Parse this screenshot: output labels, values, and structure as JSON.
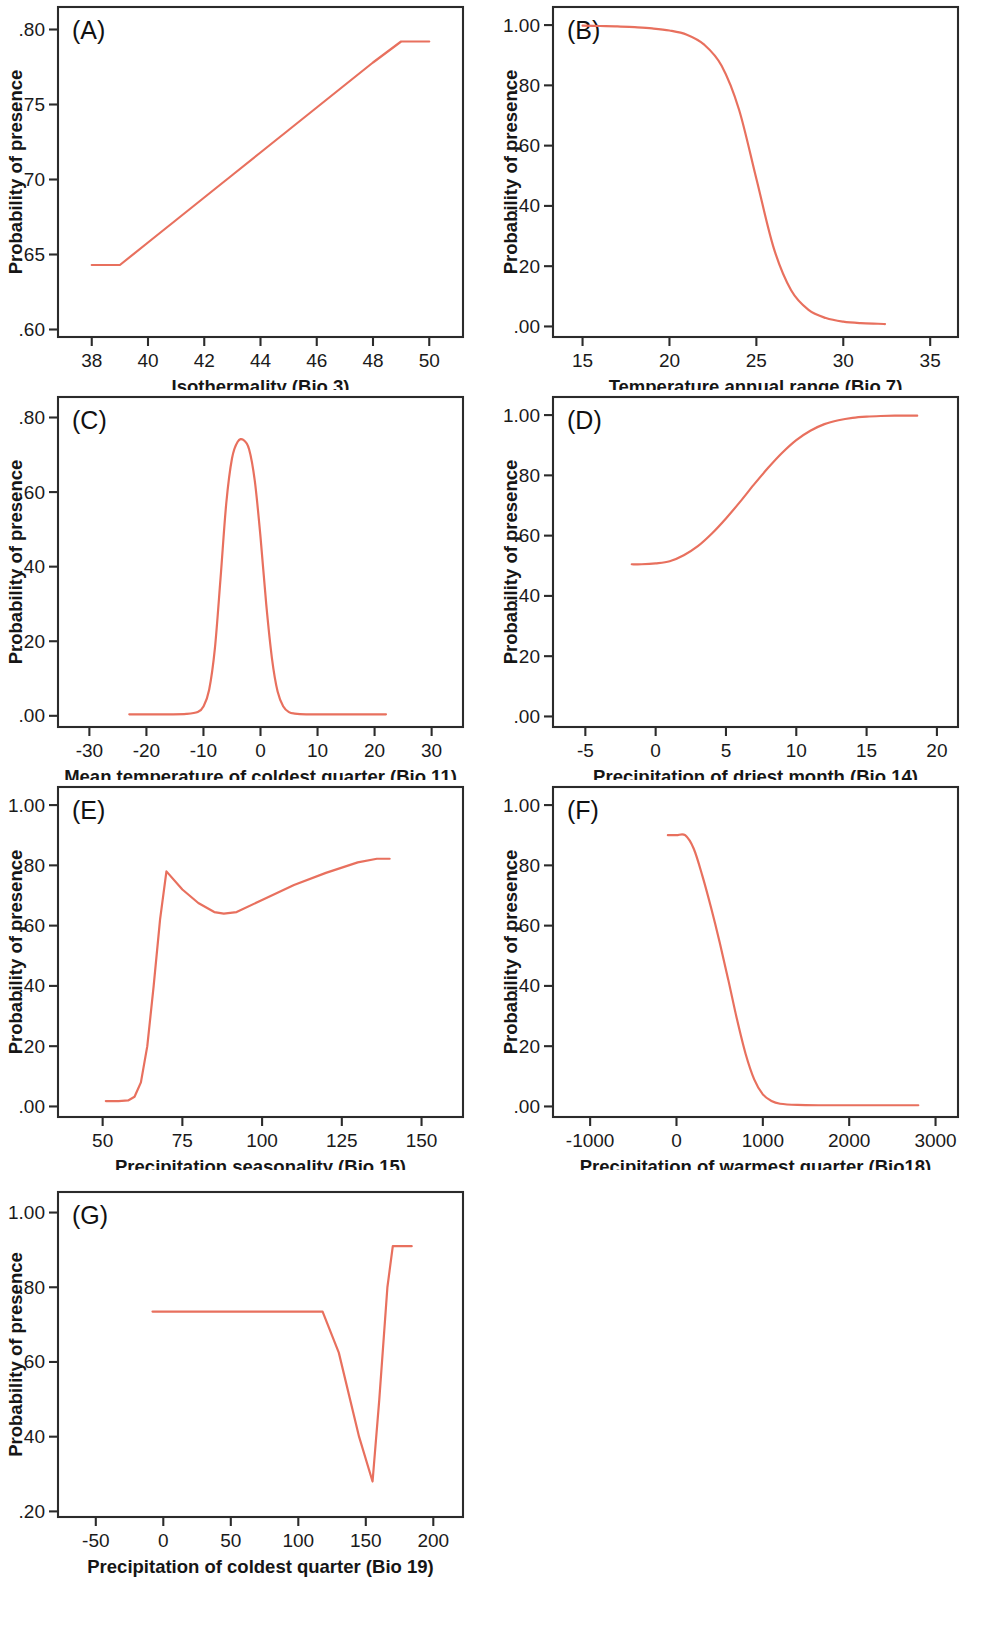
{
  "figure": {
    "background_color": "#ffffff",
    "curve_color": "#e8705e",
    "axis_color": "#2b2b2b",
    "shared_ylabel": "Probability of presence",
    "panel_count": 7
  },
  "panels": [
    {
      "letter": "(A)",
      "xlabel": "Isothermality (Bio 3)",
      "ylabel": "Probability of presence",
      "xticks": [
        38,
        40,
        42,
        44,
        46,
        48,
        50
      ],
      "xtick_labels": [
        "38",
        "40",
        "42",
        "44",
        "46",
        "48",
        "50"
      ],
      "yticks": [
        0.6,
        0.65,
        0.7,
        0.75,
        0.8
      ],
      "ytick_labels": [
        ".60",
        ".65",
        ".70",
        ".75",
        ".80"
      ],
      "xlim": [
        36.8,
        51.2
      ],
      "ylim": [
        0.595,
        0.815
      ]
    },
    {
      "letter": "(B)",
      "xlabel": "Temperature annual range (Bio 7)",
      "ylabel": "Probability of presence",
      "xticks": [
        15,
        20,
        25,
        30,
        35
      ],
      "xtick_labels": [
        "15",
        "20",
        "25",
        "30",
        "35"
      ],
      "yticks": [
        0.0,
        0.2,
        0.4,
        0.6,
        0.8,
        1.0
      ],
      "ytick_labels": [
        ".00",
        ".20",
        ".40",
        ".60",
        ".80",
        "1.00"
      ],
      "xlim": [
        13.3,
        36.6
      ],
      "ylim": [
        -0.035,
        1.06
      ]
    },
    {
      "letter": "(C)",
      "xlabel": "Mean temperature of coldest quarter (Bio 11)",
      "ylabel": "Probability of presence",
      "xticks": [
        -30,
        -20,
        -10,
        0,
        10,
        20,
        30
      ],
      "xtick_labels": [
        "-30",
        "-20",
        "-10",
        "0",
        "10",
        "20",
        "30"
      ],
      "yticks": [
        0.0,
        0.2,
        0.4,
        0.6,
        0.8
      ],
      "ytick_labels": [
        ".00",
        ".20",
        ".40",
        ".60",
        ".80"
      ],
      "xlim": [
        -35.5,
        35.5
      ],
      "ylim": [
        -0.03,
        0.855
      ]
    },
    {
      "letter": "(D)",
      "xlabel": "Precipitation of driest month (Bio 14)",
      "ylabel": "Probability of presence",
      "xticks": [
        -5,
        0,
        5,
        10,
        15,
        20
      ],
      "xtick_labels": [
        "-5",
        "0",
        "5",
        "10",
        "15",
        "20"
      ],
      "yticks": [
        0.0,
        0.2,
        0.4,
        0.6,
        0.8,
        1.0
      ],
      "ytick_labels": [
        ".00",
        ".20",
        ".40",
        ".60",
        ".80",
        "1.00"
      ],
      "xlim": [
        -7.3,
        21.5
      ],
      "ylim": [
        -0.035,
        1.06
      ]
    },
    {
      "letter": "(E)",
      "xlabel": "Precipitation seasonality (Bio 15)",
      "ylabel": "Probability of presence",
      "xticks": [
        50,
        75,
        100,
        125,
        150
      ],
      "xtick_labels": [
        "50",
        "75",
        "100",
        "125",
        "150"
      ],
      "yticks": [
        0.0,
        0.2,
        0.4,
        0.6,
        0.8,
        1.0
      ],
      "ytick_labels": [
        ".00",
        ".20",
        ".40",
        ".60",
        ".80",
        "1.00"
      ],
      "xlim": [
        36,
        163
      ],
      "ylim": [
        -0.035,
        1.06
      ]
    },
    {
      "letter": "(F)",
      "xlabel": "Precipitation of warmest quarter (Bio18)",
      "ylabel": "Probability of presence",
      "xticks": [
        -1000,
        0,
        1000,
        2000,
        3000
      ],
      "xtick_labels": [
        "-1000",
        "0",
        "1000",
        "2000",
        "3000"
      ],
      "yticks": [
        0.0,
        0.2,
        0.4,
        0.6,
        0.8,
        1.0
      ],
      "ytick_labels": [
        ".00",
        ".20",
        ".40",
        ".60",
        ".80",
        "1.00"
      ],
      "xlim": [
        -1430,
        3260
      ],
      "ylim": [
        -0.035,
        1.06
      ]
    },
    {
      "letter": "(G)",
      "xlabel": "Precipitation of coldest quarter (Bio 19)",
      "ylabel": "Probability of presence",
      "xticks": [
        -50,
        0,
        50,
        100,
        150,
        200
      ],
      "xtick_labels": [
        "-50",
        "0",
        "50",
        "100",
        "150",
        "200"
      ],
      "yticks": [
        0.2,
        0.4,
        0.6,
        0.8,
        1.0
      ],
      "ytick_labels": [
        ".20",
        ".40",
        ".60",
        ".80",
        "1.00"
      ],
      "xlim": [
        -78,
        222
      ],
      "ylim": [
        0.185,
        1.055
      ]
    }
  ],
  "chart_data": [
    {
      "type": "line",
      "panel": "(A)",
      "title": "(A)",
      "xlabel": "Isothermality (Bio 3)",
      "ylabel": "Probability of presence",
      "xlim": [
        36.8,
        51.2
      ],
      "ylim": [
        0.595,
        0.815
      ],
      "grid": false,
      "legend": "none",
      "color": "#e8705e",
      "x": [
        38.0,
        39.0,
        40.0,
        41.0,
        42.0,
        43.0,
        44.0,
        45.0,
        46.0,
        47.0,
        48.0,
        49.0,
        50.0
      ],
      "y": [
        0.643,
        0.643,
        0.658,
        0.673,
        0.688,
        0.703,
        0.718,
        0.733,
        0.748,
        0.763,
        0.778,
        0.792,
        0.792
      ]
    },
    {
      "type": "line",
      "panel": "(B)",
      "title": "(B)",
      "xlabel": "Temperature annual range (Bio 7)",
      "ylabel": "Probability of presence",
      "xlim": [
        13.3,
        36.6
      ],
      "ylim": [
        -0.035,
        1.06
      ],
      "grid": false,
      "legend": "none",
      "color": "#e8705e",
      "x": [
        15,
        16,
        17,
        18,
        19,
        20,
        21,
        22,
        23,
        24,
        25,
        26,
        27,
        28,
        29,
        30,
        31,
        32,
        32.4
      ],
      "y": [
        0.998,
        0.997,
        0.996,
        0.993,
        0.989,
        0.982,
        0.968,
        0.935,
        0.865,
        0.72,
        0.49,
        0.26,
        0.12,
        0.055,
        0.028,
        0.016,
        0.011,
        0.009,
        0.008
      ]
    },
    {
      "type": "line",
      "panel": "(C)",
      "title": "(C)",
      "xlabel": "Mean temperature of coldest quarter (Bio 11)",
      "ylabel": "Probability of presence",
      "xlim": [
        -35.5,
        35.5
      ],
      "ylim": [
        -0.03,
        0.855
      ],
      "grid": false,
      "legend": "none",
      "color": "#e8705e",
      "peak_x": -3.0,
      "peak_y": 0.74,
      "baseline": 0.004,
      "x": [
        -23,
        -20,
        -16,
        -13,
        -11,
        -10,
        -9,
        -8,
        -7,
        -6,
        -5,
        -4,
        -3,
        -2,
        -1,
        0,
        1,
        2,
        3,
        4,
        5,
        6,
        8,
        12,
        16,
        22
      ],
      "y": [
        0.004,
        0.004,
        0.004,
        0.005,
        0.01,
        0.025,
        0.07,
        0.18,
        0.37,
        0.57,
        0.69,
        0.735,
        0.74,
        0.715,
        0.63,
        0.48,
        0.3,
        0.155,
        0.065,
        0.025,
        0.01,
        0.006,
        0.004,
        0.004,
        0.004,
        0.004
      ]
    },
    {
      "type": "line",
      "panel": "(D)",
      "title": "(D)",
      "xlabel": "Precipitation of driest month (Bio 14)",
      "ylabel": "Probability of presence",
      "xlim": [
        -7.3,
        21.5
      ],
      "ylim": [
        -0.035,
        1.06
      ],
      "grid": false,
      "legend": "none",
      "color": "#e8705e",
      "x": [
        -1.7,
        -1,
        0,
        1,
        2,
        3,
        4,
        5,
        6,
        7,
        8,
        9,
        10,
        11,
        12,
        13,
        14,
        15,
        16,
        17,
        18.6
      ],
      "y": [
        0.505,
        0.505,
        0.508,
        0.515,
        0.535,
        0.565,
        0.607,
        0.657,
        0.712,
        0.77,
        0.825,
        0.875,
        0.917,
        0.948,
        0.97,
        0.983,
        0.991,
        0.995,
        0.997,
        0.998,
        0.998
      ]
    },
    {
      "type": "line",
      "panel": "(E)",
      "title": "(E)",
      "xlabel": "Precipitation seasonality (Bio 15)",
      "ylabel": "Probability of presence",
      "xlim": [
        36,
        163
      ],
      "ylim": [
        -0.035,
        1.06
      ],
      "grid": false,
      "legend": "none",
      "color": "#e8705e",
      "x": [
        51,
        55,
        58,
        60,
        62,
        64,
        66,
        68,
        70,
        75,
        80,
        85,
        88,
        92,
        100,
        110,
        120,
        130,
        136,
        140
      ],
      "y": [
        0.018,
        0.018,
        0.02,
        0.032,
        0.08,
        0.2,
        0.4,
        0.62,
        0.78,
        0.72,
        0.675,
        0.645,
        0.64,
        0.645,
        0.685,
        0.735,
        0.775,
        0.81,
        0.822,
        0.822
      ]
    },
    {
      "type": "line",
      "panel": "(F)",
      "title": "(F)",
      "xlabel": "Precipitation of warmest quarter (Bio18)",
      "ylabel": "Probability of presence",
      "xlim": [
        -1430,
        3260
      ],
      "ylim": [
        -0.035,
        1.06
      ],
      "grid": false,
      "legend": "none",
      "color": "#e8705e",
      "x": [
        -100,
        0,
        100,
        200,
        300,
        400,
        500,
        600,
        700,
        800,
        900,
        1000,
        1100,
        1200,
        1400,
        1700,
        2000,
        2400,
        2800
      ],
      "y": [
        0.9,
        0.9,
        0.9,
        0.855,
        0.765,
        0.66,
        0.545,
        0.42,
        0.29,
        0.175,
        0.09,
        0.04,
        0.018,
        0.009,
        0.005,
        0.004,
        0.004,
        0.004,
        0.004
      ]
    },
    {
      "type": "line",
      "panel": "(G)",
      "title": "(G)",
      "xlabel": "Precipitation of coldest quarter (Bio 19)",
      "ylabel": "Probability of presence",
      "xlim": [
        -78,
        222
      ],
      "ylim": [
        0.185,
        1.055
      ],
      "grid": false,
      "legend": "none",
      "color": "#e8705e",
      "x": [
        -8,
        20,
        60,
        100,
        118,
        130,
        145,
        155,
        160,
        166,
        170,
        184
      ],
      "y": [
        0.735,
        0.735,
        0.735,
        0.735,
        0.735,
        0.625,
        0.4,
        0.28,
        0.5,
        0.8,
        0.91,
        0.91
      ]
    }
  ]
}
